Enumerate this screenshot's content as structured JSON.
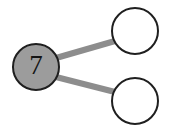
{
  "diagram": {
    "type": "node-link-diagram",
    "background_color": "#ffffff",
    "canvas": {
      "width": 173,
      "height": 135
    },
    "nodes": [
      {
        "id": "root",
        "label": "7",
        "role": "root-node",
        "filled": true,
        "fill_color": "#9c9c9c",
        "stroke_color": "#1f1f1f",
        "stroke_width": 2,
        "label_color": "#141414",
        "cx": 36,
        "cy": 67,
        "r": 23
      },
      {
        "id": "child-top",
        "label": "",
        "role": "child-node-top",
        "filled": false,
        "fill_color": "#ffffff",
        "stroke_color": "#1f1f1f",
        "stroke_width": 2,
        "label_color": "#141414",
        "cx": 135,
        "cy": 31,
        "r": 23
      },
      {
        "id": "child-bottom",
        "label": "",
        "role": "child-node-bottom",
        "filled": false,
        "fill_color": "#ffffff",
        "stroke_color": "#1f1f1f",
        "stroke_width": 2,
        "label_color": "#141414",
        "cx": 135,
        "cy": 101,
        "r": 23
      }
    ],
    "edges": [
      {
        "id": "edge-root-top",
        "from": "root",
        "to": "child-top",
        "color": "#8d8d8d",
        "width": 6,
        "x1": 56,
        "y1": 58,
        "x2": 115,
        "y2": 41
      },
      {
        "id": "edge-root-bottom",
        "from": "root",
        "to": "child-bottom",
        "color": "#8d8d8d",
        "width": 6,
        "x1": 56,
        "y1": 77,
        "x2": 115,
        "y2": 92
      }
    ]
  }
}
